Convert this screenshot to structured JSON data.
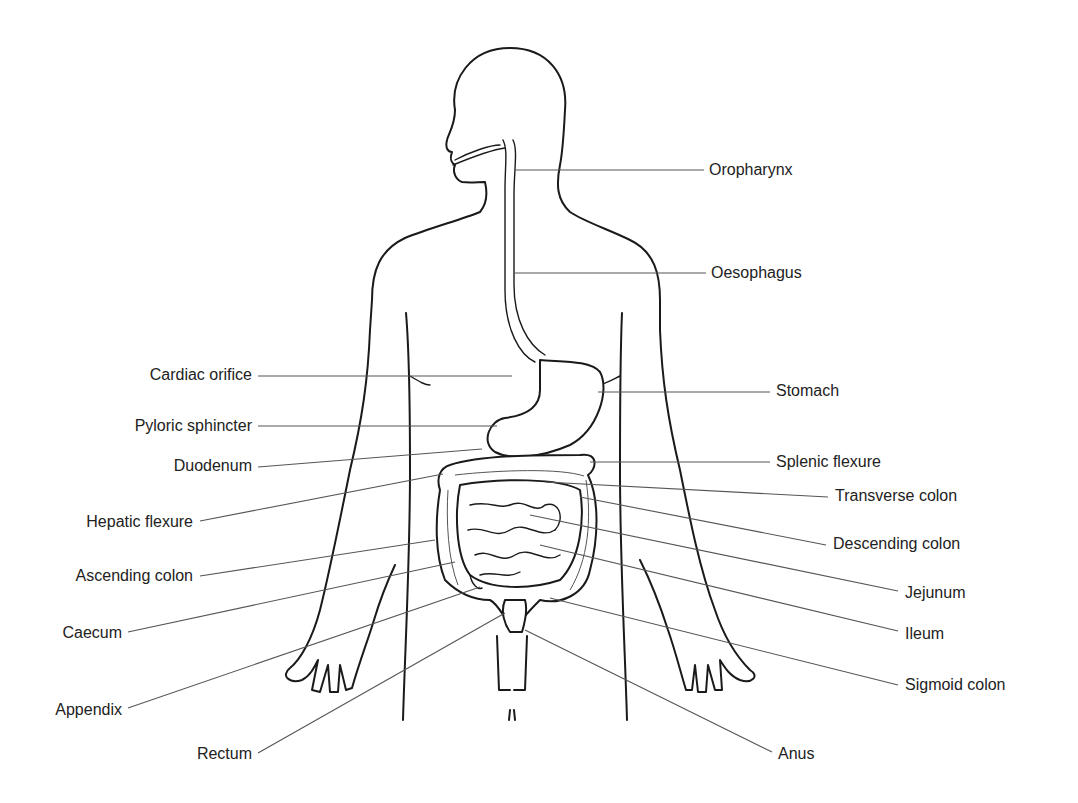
{
  "diagram": {
    "title": "",
    "colors": {
      "line": "#1a1a1a",
      "leader": "#555555",
      "text": "#222222",
      "background": "#ffffff"
    },
    "labels_left": [
      {
        "id": "cardiac-orifice",
        "text": "Cardiac orifice",
        "x": 120,
        "y": 366,
        "right": 252,
        "line": [
          258,
          376,
          512,
          376
        ]
      },
      {
        "id": "pyloric-sphincter",
        "text": "Pyloric sphincter",
        "x": 98,
        "y": 417,
        "right": 252,
        "line": [
          258,
          426,
          497,
          426
        ]
      },
      {
        "id": "duodenum",
        "text": "Duodenum",
        "x": 152,
        "y": 457,
        "right": 252,
        "line": [
          258,
          467,
          482,
          449
        ]
      },
      {
        "id": "hepatic-flexure",
        "text": "Hepatic flexure",
        "x": 58,
        "y": 513,
        "right": 193,
        "line": [
          200,
          521,
          443,
          474
        ]
      },
      {
        "id": "ascending-colon",
        "text": "Ascending colon",
        "x": 44,
        "y": 567,
        "right": 193,
        "line": [
          200,
          576,
          435,
          540
        ]
      },
      {
        "id": "caecum",
        "text": "Caecum",
        "x": 46,
        "y": 624,
        "right": 122,
        "line": [
          128,
          632,
          455,
          562
        ]
      },
      {
        "id": "appendix",
        "text": "Appendix",
        "x": 37,
        "y": 701,
        "right": 122,
        "line": [
          128,
          708,
          480,
          587
        ]
      },
      {
        "id": "rectum",
        "text": "Rectum",
        "x": 182,
        "y": 745,
        "right": 252,
        "line": [
          258,
          753,
          505,
          613
        ]
      }
    ],
    "labels_right": [
      {
        "id": "oropharynx",
        "text": "Oropharynx",
        "x": 709,
        "y": 161,
        "line": [
          514,
          170,
          704,
          170
        ]
      },
      {
        "id": "oesophagus",
        "text": "Oesophagus",
        "x": 711,
        "y": 264,
        "line": [
          515,
          273,
          706,
          273
        ]
      },
      {
        "id": "stomach",
        "text": "Stomach",
        "x": 776,
        "y": 382,
        "line": [
          598,
          392,
          770,
          392
        ]
      },
      {
        "id": "splenic-flexure",
        "text": "Splenic flexure",
        "x": 776,
        "y": 453,
        "line": [
          590,
          462,
          770,
          462
        ]
      },
      {
        "id": "transverse-colon",
        "text": "Transverse colon",
        "x": 835,
        "y": 487,
        "line": [
          545,
          482,
          828,
          497
        ]
      },
      {
        "id": "descending-colon",
        "text": "Descending colon",
        "x": 833,
        "y": 535,
        "line": [
          580,
          497,
          826,
          545
        ]
      },
      {
        "id": "jejunum",
        "text": "Jejunum",
        "x": 905,
        "y": 584,
        "line": [
          530,
          515,
          898,
          591
        ]
      },
      {
        "id": "ileum",
        "text": "Ileum",
        "x": 905,
        "y": 625,
        "line": [
          540,
          545,
          898,
          631
        ]
      },
      {
        "id": "sigmoid-colon",
        "text": "Sigmoid colon",
        "x": 905,
        "y": 676,
        "line": [
          550,
          598,
          898,
          685
        ]
      },
      {
        "id": "anus",
        "text": "Anus",
        "x": 778,
        "y": 745,
        "line": [
          525,
          630,
          772,
          752
        ]
      }
    ]
  }
}
